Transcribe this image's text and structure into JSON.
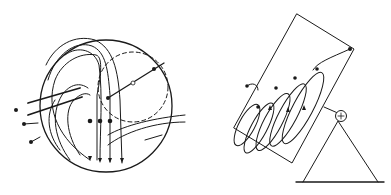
{
  "figure": {
    "background": "#ffffff",
    "stroke_color": "#1a1a1a",
    "panels": [
      {
        "id": "left",
        "description": "Circular field of view with curved flow lines, a dashed inner circle with a diameter line, three parallel descending arrows with dots, and incoming thick lines from the left",
        "labels": []
      },
      {
        "id": "right",
        "description": "Tilted rectangular plate on a triangular stand with a pivot (circle with plus sign); a looping spiral trajectory with dots and arrows inside the plate",
        "pivot_symbol": "+",
        "labels": []
      }
    ]
  }
}
